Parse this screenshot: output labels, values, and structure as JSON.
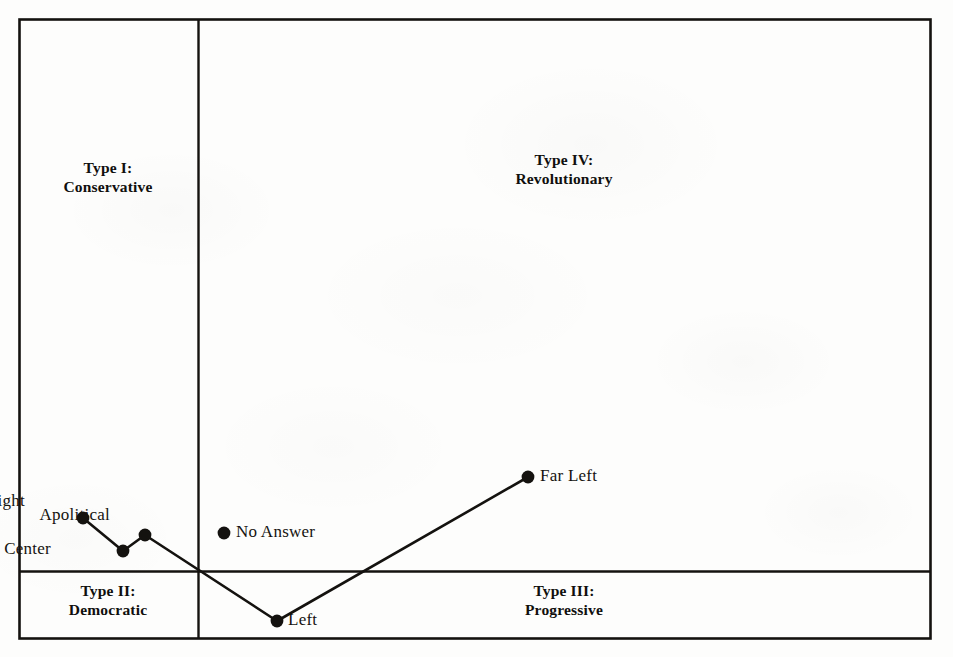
{
  "figure": {
    "background_color": "#fdfdfc",
    "ink_color": "#14120f",
    "frame": {
      "x": 19,
      "y": 19,
      "width": 911,
      "height": 619
    },
    "axes": {
      "vertical_divider_x": 198,
      "horizontal_divider_y": 571
    }
  },
  "quadrants": [
    {
      "id": "type-1",
      "line1": "Type I:",
      "line2": "Conservative",
      "cx": 108,
      "cy": 158
    },
    {
      "id": "type-4",
      "line1": "Type IV:",
      "line2": "Revolutionary",
      "cx": 564,
      "cy": 150
    },
    {
      "id": "type-2",
      "line1": "Type II:",
      "line2": "Democratic",
      "cx": 108,
      "cy": 581
    },
    {
      "id": "type-3",
      "line1": "Type III:",
      "line2": "Progressive",
      "cx": 564,
      "cy": 581
    }
  ],
  "chart_data": {
    "type": "scatter",
    "title": "",
    "subtitle": "",
    "xlabel": "",
    "ylabel": "",
    "grid": false,
    "legend_position": "none",
    "axis_style": "quadrant-cross",
    "xlim": [
      19,
      930
    ],
    "ylim": [
      19,
      638
    ],
    "annotations": [
      "Type I: Conservative",
      "Type IV: Revolutionary",
      "Type II: Democratic",
      "Type III: Progressive"
    ],
    "series": [
      {
        "name": "Political orientation profile",
        "connected": true,
        "marker": "filled-circle",
        "points": [
          {
            "label": "Right",
            "x": 83,
            "y": 518,
            "label_dx": -58,
            "label_dy": -27
          },
          {
            "label": "Center",
            "x": 123,
            "y": 551,
            "label_dx": -72,
            "label_dy": -12
          },
          {
            "label": "Apolitical",
            "x": 145,
            "y": 535,
            "label_dx": -35,
            "label_dy": -30
          },
          {
            "label": "Left",
            "x": 277,
            "y": 621,
            "label_dx": 11,
            "label_dy": -11
          },
          {
            "label": "Far Left",
            "x": 528,
            "y": 477,
            "label_dx": 12,
            "label_dy": -11
          }
        ]
      },
      {
        "name": "Unconnected response",
        "connected": false,
        "marker": "filled-circle",
        "points": [
          {
            "label": "No Answer",
            "x": 224,
            "y": 533,
            "label_dx": 12,
            "label_dy": -11
          }
        ]
      }
    ]
  }
}
